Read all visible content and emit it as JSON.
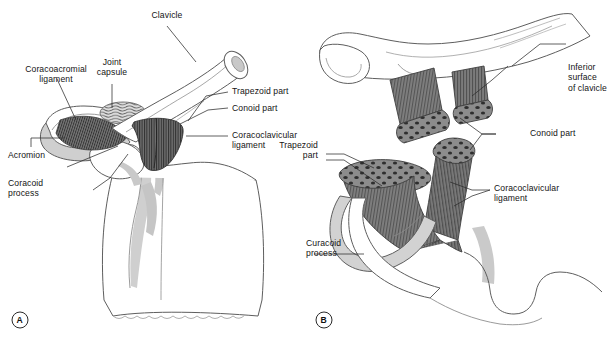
{
  "figure": {
    "panels": [
      {
        "tag": "A",
        "name": "anterior-view-of-shoulder-girdle",
        "labels": [
          {
            "key": "clavicle",
            "text": "Clavicle"
          },
          {
            "key": "joint_capsule",
            "text": "Joint\ncapsule"
          },
          {
            "key": "coracoacromial",
            "text": "Coracoacromial\nligament"
          },
          {
            "key": "trapezoid_part",
            "text": "Trapezoid part"
          },
          {
            "key": "conoid_part",
            "text": "Conoid part"
          },
          {
            "key": "coracoclavicular",
            "text": "Coracoclavicular\nligament"
          },
          {
            "key": "acromion",
            "text": "Acromion"
          },
          {
            "key": "coracoid_process",
            "text": "Coracoid\nprocess"
          }
        ]
      },
      {
        "tag": "B",
        "name": "ligament-detail-view",
        "labels": [
          {
            "key": "inferior_surface",
            "text": "Inferior\nsurface\nof clavicle"
          },
          {
            "key": "conoid_part",
            "text": "Conoid part"
          },
          {
            "key": "trapezoid_part",
            "text": "Trapezoid\npart"
          },
          {
            "key": "coracoclavicular",
            "text": "Coracoclavicular\nligament"
          },
          {
            "key": "curacoid_process",
            "text": "Curacoid\nprocess"
          }
        ]
      }
    ]
  },
  "colors": {
    "background": "#ffffff",
    "outline": "#4a4a4a",
    "bone_fill": "#ffffff",
    "bone_shade": "#c9c9c9",
    "ligament_dark": "#6e6e6e",
    "ligament_mid": "#7d7d7d",
    "ligament_hatch": "#3d3d3d",
    "capsule": "#d0d0d0",
    "text": "#141414",
    "leader": "#2b2b2b"
  }
}
